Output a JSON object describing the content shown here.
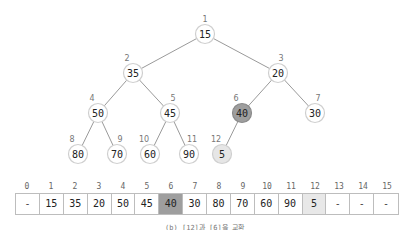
{
  "tree": {
    "nodes": [
      {
        "index": "1",
        "value": "15",
        "x": 205,
        "y": 34,
        "state": "normal"
      },
      {
        "index": "2",
        "value": "35",
        "x": 133,
        "y": 73,
        "state": "normal"
      },
      {
        "index": "3",
        "value": "20",
        "x": 278,
        "y": 73,
        "state": "normal"
      },
      {
        "index": "4",
        "value": "50",
        "x": 98,
        "y": 113,
        "state": "normal"
      },
      {
        "index": "5",
        "value": "45",
        "x": 170,
        "y": 113,
        "state": "normal"
      },
      {
        "index": "6",
        "value": "40",
        "x": 242,
        "y": 113,
        "state": "swap-a"
      },
      {
        "index": "7",
        "value": "30",
        "x": 315,
        "y": 113,
        "state": "normal"
      },
      {
        "index": "8",
        "value": "80",
        "x": 78,
        "y": 154,
        "state": "normal"
      },
      {
        "index": "9",
        "value": "70",
        "x": 117,
        "y": 154,
        "state": "normal"
      },
      {
        "index": "10",
        "value": "60",
        "x": 150,
        "y": 154,
        "state": "normal"
      },
      {
        "index": "11",
        "value": "90",
        "x": 189,
        "y": 154,
        "state": "normal"
      },
      {
        "index": "12",
        "value": "5",
        "x": 222,
        "y": 154,
        "state": "swap-b"
      }
    ],
    "edges": [
      [
        1,
        2
      ],
      [
        1,
        3
      ],
      [
        2,
        4
      ],
      [
        2,
        5
      ],
      [
        3,
        6
      ],
      [
        3,
        7
      ],
      [
        4,
        8
      ],
      [
        4,
        9
      ],
      [
        5,
        10
      ],
      [
        5,
        11
      ],
      [
        6,
        12
      ]
    ]
  },
  "array": {
    "indices": [
      "0",
      "1",
      "2",
      "3",
      "4",
      "5",
      "6",
      "7",
      "8",
      "9",
      "10",
      "11",
      "12",
      "13",
      "14",
      "15"
    ],
    "cells": [
      {
        "value": "-",
        "state": "empty"
      },
      {
        "value": "15",
        "state": "normal"
      },
      {
        "value": "35",
        "state": "normal"
      },
      {
        "value": "20",
        "state": "normal"
      },
      {
        "value": "50",
        "state": "normal"
      },
      {
        "value": "45",
        "state": "normal"
      },
      {
        "value": "40",
        "state": "swap-a"
      },
      {
        "value": "30",
        "state": "normal"
      },
      {
        "value": "80",
        "state": "normal"
      },
      {
        "value": "70",
        "state": "normal"
      },
      {
        "value": "60",
        "state": "normal"
      },
      {
        "value": "90",
        "state": "normal"
      },
      {
        "value": "5",
        "state": "swap-b"
      },
      {
        "value": "-",
        "state": "empty"
      },
      {
        "value": "-",
        "state": "empty"
      },
      {
        "value": "-",
        "state": "empty"
      }
    ]
  },
  "caption": "(b) [12]과 [6]을 교환"
}
